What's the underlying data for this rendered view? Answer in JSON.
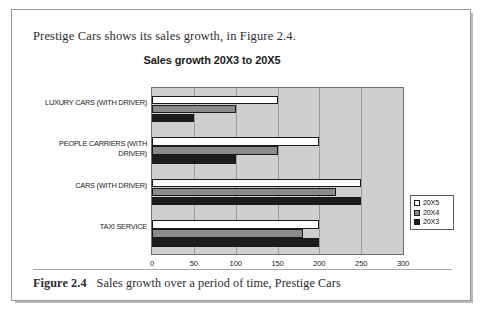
{
  "page": {
    "intro_text": "Prestige Cars shows its sales growth, in Figure 2.4.",
    "caption_figure_number": "Figure 2.4",
    "caption_text": "Sales growth over a period of time, Prestige Cars"
  },
  "colors": {
    "series_20X5": "#ffffff",
    "series_20X4": "#8a8a8a",
    "series_20X3": "#1d1d1d",
    "plot_background": "#cfcfcf",
    "gridline": "#9b9b9b",
    "axis_line": "#6e6e6e",
    "page_border": "#9a9a9a"
  },
  "chart_data": {
    "type": "bar",
    "orientation": "horizontal",
    "title": "Sales growth 20X3 to 20X5",
    "xlabel": "",
    "ylabel": "",
    "xlim": [
      0,
      300
    ],
    "xticks": [
      0,
      50,
      100,
      150,
      200,
      250,
      300
    ],
    "grid": true,
    "legend_position": "right",
    "categories": [
      "LUXURY CARS (WITH DRIVER)",
      "PEOPLE CARRIERS (WITH DRIVER)",
      "CARS (WITH DRIVER)",
      "TAXI SERVICE"
    ],
    "series": [
      {
        "name": "20X5",
        "values": [
          150,
          200,
          250,
          200
        ]
      },
      {
        "name": "20X4",
        "values": [
          100,
          150,
          220,
          180
        ]
      },
      {
        "name": "20X3",
        "values": [
          50,
          100,
          250,
          200
        ]
      }
    ]
  }
}
